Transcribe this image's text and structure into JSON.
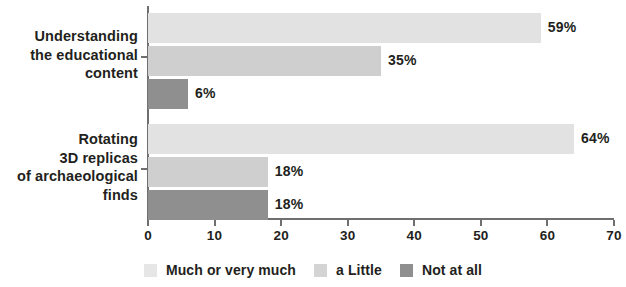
{
  "chart_data": {
    "type": "bar",
    "orientation": "horizontal",
    "title": "",
    "xlabel": "",
    "ylabel": "",
    "xlim": [
      0,
      70
    ],
    "xticks": [
      0,
      10,
      20,
      30,
      40,
      50,
      60,
      70
    ],
    "xtick_labels": [
      "0",
      "10",
      "20",
      "30",
      "40",
      "50",
      "60",
      "70"
    ],
    "grid": false,
    "legend_position": "bottom",
    "categories": [
      "Understanding\nthe educational\ncontent",
      "Rotating\n3D replicas\nof archaeological\nfinds"
    ],
    "series": [
      {
        "name": "Much or very much",
        "color": "#e2e2e2",
        "values": [
          59,
          64
        ],
        "value_labels": [
          "59%",
          "64%"
        ]
      },
      {
        "name": "a Little",
        "color": "#cfcfcf",
        "values": [
          35,
          18
        ],
        "value_labels": [
          "35%",
          "18%"
        ]
      },
      {
        "name": "Not at all",
        "color": "#8f8f8f",
        "values": [
          6,
          18
        ],
        "value_labels": [
          "6%",
          "18%"
        ]
      }
    ]
  },
  "legend": {
    "items": [
      {
        "label": "Much or very much",
        "color": "#e6e6e6"
      },
      {
        "label": "a Little",
        "color": "#d4d4d4"
      },
      {
        "label": "Not at all",
        "color": "#8f8f8f"
      }
    ]
  },
  "axis": {
    "x_tick_labels": [
      "0",
      "10",
      "20",
      "30",
      "40",
      "50",
      "60",
      "70"
    ]
  }
}
